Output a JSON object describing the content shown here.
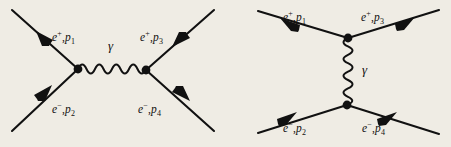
{
  "figure": {
    "background_color": "#efece4",
    "ink_color": "#111111"
  },
  "diagrams": [
    {
      "id": "s-channel",
      "name": "annihilation-diagram",
      "propagator_orientation": "horizontal",
      "propagator_label": "γ",
      "legs": [
        {
          "position": "top-left",
          "particle": "e",
          "charge": "+",
          "momentum": "p",
          "index": "1",
          "arrow": "outgoing"
        },
        {
          "position": "top-right",
          "particle": "e",
          "charge": "+",
          "momentum": "p",
          "index": "3",
          "arrow": "incoming"
        },
        {
          "position": "bottom-left",
          "particle": "e",
          "charge": "−",
          "momentum": "p",
          "index": "2",
          "arrow": "incoming"
        },
        {
          "position": "bottom-right",
          "particle": "e",
          "charge": "−",
          "momentum": "p",
          "index": "4",
          "arrow": "outgoing"
        }
      ]
    },
    {
      "id": "t-channel",
      "name": "scattering-diagram",
      "propagator_orientation": "vertical",
      "propagator_label": "γ",
      "legs": [
        {
          "position": "top-left",
          "particle": "e",
          "charge": "+",
          "momentum": "p",
          "index": "1",
          "arrow": "outgoing"
        },
        {
          "position": "top-right",
          "particle": "e",
          "charge": "+",
          "momentum": "p",
          "index": "3",
          "arrow": "incoming"
        },
        {
          "position": "bottom-left",
          "particle": "e",
          "charge": "−",
          "momentum": "p",
          "index": "2",
          "arrow": "incoming"
        },
        {
          "position": "bottom-right",
          "particle": "e",
          "charge": "−",
          "momentum": "p",
          "index": "4",
          "arrow": "outgoing"
        }
      ]
    }
  ],
  "labels": {
    "s_top_left": {
      "e": "e",
      "charge": "+",
      "comma": ",",
      "p": "p",
      "sub": "1"
    },
    "s_top_right": {
      "e": "e",
      "charge": "+",
      "comma": ",",
      "p": "p",
      "sub": "3"
    },
    "s_bottom_left": {
      "e": "e",
      "charge": "−",
      "comma": ",",
      "p": "p",
      "sub": "2"
    },
    "s_bottom_right": {
      "e": "e",
      "charge": "−",
      "comma": ",",
      "p": "p",
      "sub": "4"
    },
    "s_photon": "γ",
    "t_top_left": {
      "e": "e",
      "charge": "+",
      "comma": ",",
      "p": "p",
      "sub": "1"
    },
    "t_top_right": {
      "e": "e",
      "charge": "+",
      "comma": ",",
      "p": "p",
      "sub": "3"
    },
    "t_bottom_left": {
      "e": "e",
      "charge": "−",
      "comma": ",",
      "p": "p",
      "sub": "2"
    },
    "t_bottom_right": {
      "e": "e",
      "charge": "−",
      "comma": ",",
      "p": "p",
      "sub": "4"
    },
    "t_photon": "γ"
  }
}
